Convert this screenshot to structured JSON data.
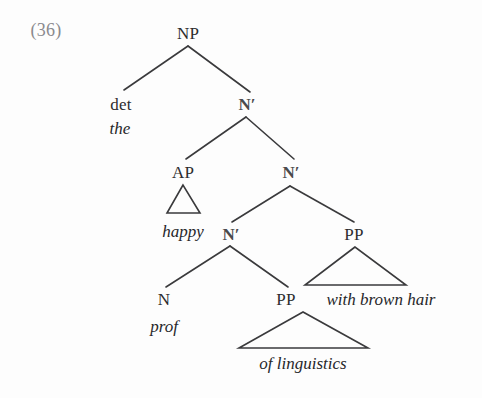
{
  "figure": {
    "example_number": "(36)",
    "ink_color": "#2c2c2e",
    "line_color": "#3a3a3c",
    "background_color": "#fdfdfd",
    "number_color": "#8a8a8e"
  },
  "tree": {
    "nodes": [
      {
        "id": "np",
        "label": "NP",
        "kind": "category",
        "x": 188,
        "y": 33
      },
      {
        "id": "det",
        "label": "det",
        "kind": "category",
        "x": 121,
        "y": 104
      },
      {
        "id": "the",
        "label": "the",
        "kind": "terminal",
        "x": 120,
        "y": 128
      },
      {
        "id": "nbar1",
        "label": "N′",
        "kind": "category-bar",
        "x": 247,
        "y": 104
      },
      {
        "id": "ap",
        "label": "AP",
        "kind": "category",
        "x": 183,
        "y": 172
      },
      {
        "id": "happy",
        "label": "happy",
        "kind": "terminal",
        "x": 183,
        "y": 231
      },
      {
        "id": "nbar2",
        "label": "N′",
        "kind": "category-bar",
        "x": 291,
        "y": 172
      },
      {
        "id": "nbar3",
        "label": "N′",
        "kind": "category-bar",
        "x": 231,
        "y": 234
      },
      {
        "id": "pp2",
        "label": "PP",
        "kind": "category",
        "x": 354,
        "y": 234
      },
      {
        "id": "wbh",
        "label": "with brown hair",
        "kind": "terminal",
        "x": 381,
        "y": 299
      },
      {
        "id": "n",
        "label": "N",
        "kind": "category",
        "x": 164,
        "y": 299
      },
      {
        "id": "prof",
        "label": "prof",
        "kind": "terminal",
        "x": 164,
        "y": 326
      },
      {
        "id": "pp1",
        "label": "PP",
        "kind": "category",
        "x": 286,
        "y": 299
      },
      {
        "id": "ofl",
        "label": "of linguistics",
        "kind": "terminal",
        "x": 303,
        "y": 363
      }
    ],
    "branches": [
      {
        "from": "np",
        "to": "det",
        "x1": 188,
        "y1": 46,
        "x2": 124,
        "y2": 90
      },
      {
        "from": "np",
        "to": "nbar1",
        "x1": 188,
        "y1": 46,
        "x2": 250,
        "y2": 92
      },
      {
        "from": "nbar1",
        "to": "ap",
        "x1": 246,
        "y1": 117,
        "x2": 186,
        "y2": 159
      },
      {
        "from": "nbar1",
        "to": "nbar2",
        "x1": 246,
        "y1": 117,
        "x2": 294,
        "y2": 159
      },
      {
        "from": "nbar2",
        "to": "nbar3",
        "x1": 290,
        "y1": 186,
        "x2": 232,
        "y2": 222
      },
      {
        "from": "nbar2",
        "to": "pp2",
        "x1": 290,
        "y1": 186,
        "x2": 354,
        "y2": 222
      },
      {
        "from": "nbar3",
        "to": "n",
        "x1": 230,
        "y1": 246,
        "x2": 166,
        "y2": 287
      },
      {
        "from": "nbar3",
        "to": "pp1",
        "x1": 230,
        "y1": 246,
        "x2": 288,
        "y2": 287
      }
    ],
    "triangles": [
      {
        "id": "tri-ap",
        "over": "happy",
        "apex_x": 183,
        "apex_y": 185,
        "left_x": 167,
        "right_x": 200,
        "base_y": 213
      },
      {
        "id": "tri-pp2",
        "over": "with brown hair",
        "apex_x": 355,
        "apex_y": 247,
        "left_x": 305,
        "right_x": 406,
        "base_y": 285
      },
      {
        "id": "tri-pp1",
        "over": "of linguistics",
        "apex_x": 303,
        "apex_y": 312,
        "left_x": 239,
        "right_x": 368,
        "base_y": 348
      }
    ]
  }
}
